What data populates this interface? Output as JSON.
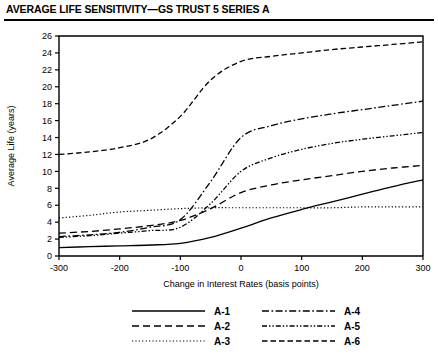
{
  "chart_data": {
    "type": "line",
    "title": "AVERAGE LIFE SENSITIVITY—GS TRUST 5 SERIES A",
    "xlabel": "Change in Interest Rates (basis points)",
    "ylabel": "Average Life (years)",
    "xlim": [
      -300,
      300
    ],
    "ylim": [
      0,
      26
    ],
    "grid": false,
    "legend_position": "bottom",
    "x": [
      -300,
      -250,
      -200,
      -150,
      -100,
      -50,
      0,
      50,
      100,
      150,
      200,
      250,
      300
    ],
    "xticks": [
      "-300",
      "-200",
      "-100",
      "0",
      "100",
      "200",
      "300"
    ],
    "xtick_values": [
      -300,
      -200,
      -100,
      0,
      100,
      200,
      300
    ],
    "yticks": [
      "0",
      "2",
      "4",
      "6",
      "8",
      "10",
      "12",
      "14",
      "16",
      "18",
      "20",
      "22",
      "24",
      "26"
    ],
    "ytick_values": [
      0,
      2,
      4,
      6,
      8,
      10,
      12,
      14,
      16,
      18,
      20,
      22,
      24,
      26
    ],
    "series": [
      {
        "name": "A-1",
        "style": "solid",
        "values": [
          1.0,
          1.1,
          1.2,
          1.3,
          1.5,
          2.2,
          3.3,
          4.5,
          5.5,
          6.4,
          7.3,
          8.2,
          9.0
        ]
      },
      {
        "name": "A-2",
        "style": "dashed",
        "values": [
          2.7,
          2.9,
          3.2,
          3.6,
          4.2,
          5.6,
          7.5,
          8.4,
          9.0,
          9.5,
          10.0,
          10.4,
          10.7
        ]
      },
      {
        "name": "A-3",
        "style": "dotted",
        "values": [
          4.5,
          4.8,
          5.2,
          5.4,
          5.6,
          5.7,
          5.7,
          5.7,
          5.7,
          5.7,
          5.8,
          5.8,
          5.8
        ]
      },
      {
        "name": "A-4",
        "style": "dash-dot",
        "values": [
          2.3,
          2.5,
          2.8,
          3.4,
          4.3,
          8.8,
          14.0,
          15.4,
          16.2,
          16.8,
          17.3,
          17.8,
          18.3
        ]
      },
      {
        "name": "A-5",
        "style": "dash-dot-dot",
        "values": [
          2.2,
          2.4,
          2.7,
          3.0,
          3.4,
          6.2,
          10.0,
          11.6,
          12.6,
          13.3,
          13.8,
          14.2,
          14.6
        ]
      },
      {
        "name": "A-6",
        "style": "long-dash",
        "values": [
          12.0,
          12.3,
          12.8,
          13.8,
          16.5,
          20.8,
          23.0,
          23.6,
          24.0,
          24.4,
          24.7,
          25.0,
          25.3
        ]
      }
    ]
  },
  "legend": {
    "entries": [
      {
        "label": "A-1"
      },
      {
        "label": "A-2"
      },
      {
        "label": "A-3"
      },
      {
        "label": "A-4"
      },
      {
        "label": "A-5"
      },
      {
        "label": "A-6"
      }
    ]
  },
  "colors": {
    "ink": "#000000",
    "background": "#ffffff"
  }
}
